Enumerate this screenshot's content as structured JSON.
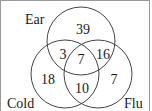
{
  "diagram": {
    "type": "venn-3",
    "sets": [
      {
        "name": "Ear",
        "label": "Ear"
      },
      {
        "name": "Cold",
        "label": "Cold"
      },
      {
        "name": "Flu",
        "label": "Flu"
      }
    ],
    "regions": {
      "ear_only": "39",
      "cold_only": "18",
      "flu_only": "7",
      "ear_cold": "3",
      "ear_flu": "16",
      "cold_flu": "10",
      "all_three": "7"
    },
    "stroke_color": "#444444",
    "text_color": "#1a1a1a"
  }
}
